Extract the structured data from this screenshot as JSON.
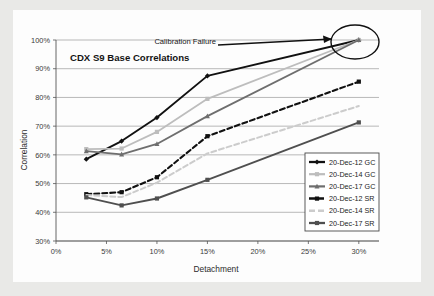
{
  "chart_data": {
    "type": "line",
    "title": "CDX S9 Base Correlations",
    "xlabel": "Detachment",
    "ylabel": "Correlation",
    "xlim": [
      0,
      32
    ],
    "ylim": [
      30,
      100
    ],
    "xticks": [
      "0%",
      "5%",
      "10%",
      "15%",
      "20%",
      "25%",
      "30%"
    ],
    "xtick_values": [
      0,
      5,
      10,
      15,
      20,
      25,
      30
    ],
    "yticks": [
      "30%",
      "40%",
      "50%",
      "60%",
      "70%",
      "80%",
      "90%",
      "100%"
    ],
    "ytick_values": [
      30,
      40,
      50,
      60,
      70,
      80,
      90,
      100
    ],
    "grid": true,
    "legend_position": "lower right",
    "x": [
      3,
      6.5,
      10,
      15,
      30
    ],
    "series": [
      {
        "name": "20-Dec-12 GC",
        "values": [
          58.5,
          64.8,
          73.0,
          87.5,
          100.0
        ],
        "color": "#111111",
        "dash": "none",
        "width": 1.9,
        "marker": "diamond"
      },
      {
        "name": "20-Dec-14 GC",
        "values": [
          62.0,
          62.2,
          68.0,
          79.5,
          100.0
        ],
        "color": "#bdbdbd",
        "dash": "none",
        "width": 1.8,
        "marker": "square"
      },
      {
        "name": "20-Dec-17 GC",
        "values": [
          61.3,
          60.2,
          63.8,
          73.5,
          100.0
        ],
        "color": "#6e6e6e",
        "dash": "none",
        "width": 1.8,
        "marker": "triangle"
      },
      {
        "name": "20-Dec-12 SR",
        "values": [
          46.3,
          47.0,
          52.2,
          66.5,
          85.5
        ],
        "color": "#111111",
        "dash": "5,3",
        "width": 2.1,
        "marker": "square"
      },
      {
        "name": "20-Dec-14 SR",
        "values": [
          46.0,
          45.3,
          50.3,
          60.5,
          77.0
        ],
        "color": "#cccccc",
        "dash": "5,3",
        "width": 2.0,
        "marker": "none"
      },
      {
        "name": "20-Dec-17 SR",
        "values": [
          45.2,
          42.4,
          44.8,
          51.3,
          71.3
        ],
        "color": "#4f4f4f",
        "dash": "none",
        "width": 1.9,
        "marker": "square"
      }
    ],
    "annotations": [
      {
        "text": "Calibration Failure",
        "target_x": 30,
        "target_y": 100
      }
    ]
  },
  "colors": {
    "paper_background": "#fdfdfd",
    "scan_border": "#e9e9e7",
    "gridline": "#9a9a9a",
    "axis": "#555555",
    "text": "#1c1c1c",
    "annotation": "#111111"
  }
}
